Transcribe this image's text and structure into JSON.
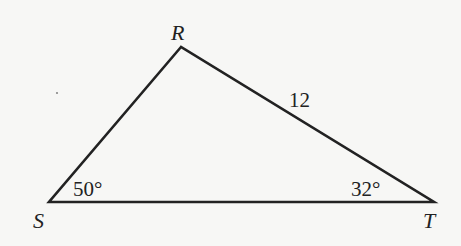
{
  "diagram": {
    "type": "triangle",
    "vertices": [
      {
        "name": "R",
        "x": 181,
        "y": 47
      },
      {
        "name": "S",
        "x": 49,
        "y": 202
      },
      {
        "name": "T",
        "x": 434,
        "y": 202
      }
    ],
    "labels": {
      "vertex_r": "R",
      "vertex_s": "S",
      "vertex_t": "T",
      "side_rt_length": "12",
      "angle_s": "50°",
      "angle_t": "32°"
    },
    "stroke_color": "#222222",
    "background_color": "#f7f7f5",
    "stray_dot": {
      "x": 57,
      "y": 93
    }
  }
}
